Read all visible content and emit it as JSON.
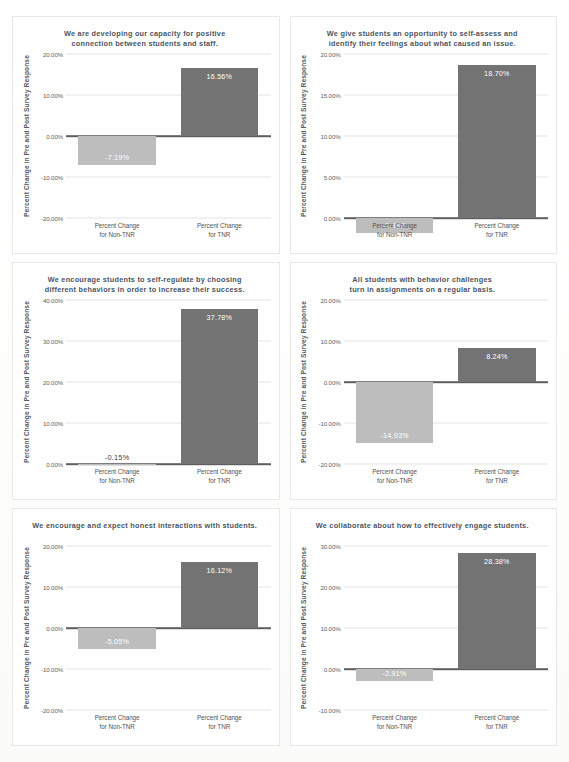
{
  "document": {
    "kind": "survey-results-chart-sheet",
    "page_background": "#fdfdfc",
    "card_border_color": "#e9e9e9"
  },
  "colors": {
    "bar_dark": "#737373",
    "bar_light": "#bdbdbd",
    "gridline": "#e4e4e4",
    "zero_axis": "#5e5e5e",
    "title_text": "#4b5563",
    "tick_text": "#5a5f66",
    "value_text_inside": "#ffffff",
    "value_text_outside": "#3b4149"
  },
  "shared": {
    "y_axis_title": "Percent Change in Pre and Post Survey Response",
    "category_non_tnr_line1": "Percent Change",
    "category_non_tnr_line2": "for Non-TNR",
    "category_tnr_line1": "Percent Change",
    "category_tnr_line2": "for TNR"
  },
  "chart_data": [
    {
      "id": "chart-1",
      "type": "bar",
      "title": "We are developing our capacity for positive connection between students and staff.",
      "title_lines": [
        "We are developing our capacity for positive",
        "connection between students and staff."
      ],
      "xlabel": "",
      "ylabel": "Percent Change in Pre and Post Survey Response",
      "categories": [
        "Percent Change for Non-TNR",
        "Percent Change for TNR"
      ],
      "values": [
        -7.19,
        16.56
      ],
      "value_labels": [
        "-7.19%",
        "16.56%"
      ],
      "ylim": [
        -20,
        20
      ],
      "yticks": [
        -20,
        -10,
        0,
        10,
        20
      ],
      "ytick_labels": [
        "-20.00%",
        "-10.00%",
        "0.00%",
        "10.00%",
        "20.00%"
      ],
      "grid": true,
      "legend": "none"
    },
    {
      "id": "chart-2",
      "type": "bar",
      "title": "We give students an opportunity to self-assess and identify their feelings about what caused an issue.",
      "title_lines": [
        "We give students an opportunity to self-assess and",
        "identify their feelings about what caused an issue."
      ],
      "xlabel": "",
      "ylabel": "Percent Change in Pre and Post Survey Response",
      "categories": [
        "Percent Change for Non-TNR",
        "Percent Change for TNR"
      ],
      "values": [
        -1.83,
        18.7
      ],
      "value_labels": [
        "-1.83%",
        "18.70%"
      ],
      "ylim": [
        0,
        20
      ],
      "yticks": [
        0,
        5,
        10,
        15,
        20
      ],
      "ytick_labels": [
        "0.00%",
        "5.00%",
        "10.00%",
        "15.00%",
        "20.00%"
      ],
      "grid": true,
      "legend": "none"
    },
    {
      "id": "chart-3",
      "type": "bar",
      "title": "We encourage students to self-regulate by choosing different behaviors in order to increase their success.",
      "title_lines": [
        "We encourage students to self-regulate by choosing",
        "different behaviors in order to increase their success."
      ],
      "xlabel": "",
      "ylabel": "Percent Change in Pre and Post Survey Response",
      "categories": [
        "Percent Change for Non-TNR",
        "Percent Change for TNR"
      ],
      "values": [
        -0.15,
        37.78
      ],
      "value_labels": [
        "-0.15%",
        "37.78%"
      ],
      "ylim": [
        0,
        40
      ],
      "yticks": [
        0,
        10,
        20,
        30,
        40
      ],
      "ytick_labels": [
        "0.00%",
        "10.00%",
        "20.00%",
        "30.00%",
        "40.00%"
      ],
      "grid": true,
      "legend": "none"
    },
    {
      "id": "chart-4",
      "type": "bar",
      "title": "All students with behavior challenges turn in assignments on a regular basis.",
      "title_lines": [
        "All students with behavior challenges",
        "turn in assignments on a regular basis."
      ],
      "xlabel": "",
      "ylabel": "Percent Change in Pre and Post Survey Response",
      "categories": [
        "Percent Change for Non-TNR",
        "Percent Change for TNR"
      ],
      "values": [
        -14.93,
        8.24
      ],
      "value_labels": [
        "-14.93%",
        "8.24%"
      ],
      "ylim": [
        -20,
        20
      ],
      "yticks": [
        -20,
        -10,
        0,
        10,
        20
      ],
      "ytick_labels": [
        "-20.00%",
        "-10.00%",
        "0.00%",
        "10.00%",
        "20.00%"
      ],
      "grid": true,
      "legend": "none"
    },
    {
      "id": "chart-5",
      "type": "bar",
      "title": "We encourage and expect honest interactions with students.",
      "title_lines": [
        "We encourage and expect honest interactions with students."
      ],
      "xlabel": "",
      "ylabel": "Percent Change in Pre and Post Survey Response",
      "categories": [
        "Percent Change for Non-TNR",
        "Percent Change for TNR"
      ],
      "values": [
        -5.05,
        16.12
      ],
      "value_labels": [
        "-5.05%",
        "16.12%"
      ],
      "ylim": [
        -20,
        20
      ],
      "yticks": [
        -20,
        -10,
        0,
        10,
        20
      ],
      "ytick_labels": [
        "-20.00%",
        "-10.00%",
        "0.00%",
        "10.00%",
        "20.00%"
      ],
      "grid": true,
      "legend": "none"
    },
    {
      "id": "chart-6",
      "type": "bar",
      "title": "We collaborate about how to effectively engage students.",
      "title_lines": [
        "We collaborate about how to effectively engage students."
      ],
      "xlabel": "",
      "ylabel": "Percent Change in Pre and Post Survey Response",
      "categories": [
        "Percent Change for Non-TNR",
        "Percent Change for TNR"
      ],
      "values": [
        -2.91,
        28.38
      ],
      "value_labels": [
        "-2.91%",
        "28.38%"
      ],
      "ylim": [
        -10,
        30
      ],
      "yticks": [
        -10,
        0,
        10,
        20,
        30
      ],
      "ytick_labels": [
        "-10.00%",
        "0.00%",
        "10.00%",
        "20.00%",
        "30.00%"
      ],
      "grid": true,
      "legend": "none"
    }
  ]
}
